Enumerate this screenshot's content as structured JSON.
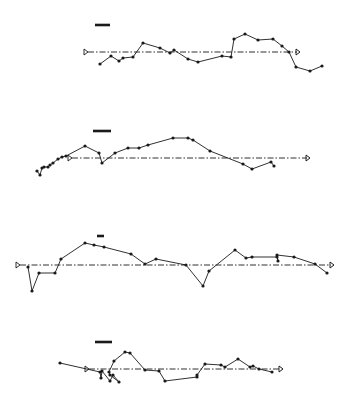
{
  "figure": {
    "width": 354,
    "height": 407,
    "background": "#ffffff",
    "ink": "#1a1a1a"
  },
  "chart_data": [
    {
      "type": "line",
      "title": "",
      "xlabel": "",
      "ylabel": "",
      "grid": false,
      "legend": null,
      "scale_bar": {
        "x1": 95,
        "x2": 110,
        "y": 25
      },
      "reference_arrow": {
        "x1": 84,
        "x2": 300,
        "y": 52,
        "style": "dash-dot",
        "start_marker": "triangle-open",
        "end_marker": "arrow-open"
      },
      "points": [
        [
          100,
          64
        ],
        [
          111,
          56
        ],
        [
          119,
          61
        ],
        [
          123,
          58
        ],
        [
          133,
          57
        ],
        [
          143,
          43
        ],
        [
          160,
          48
        ],
        [
          170,
          53
        ],
        [
          174,
          50
        ],
        [
          188,
          59
        ],
        [
          198,
          62
        ],
        [
          222,
          56
        ],
        [
          231,
          57
        ],
        [
          234,
          39
        ],
        [
          245,
          34
        ],
        [
          258,
          40
        ],
        [
          273,
          39
        ],
        [
          282,
          46
        ],
        [
          289,
          52
        ],
        [
          296,
          67
        ],
        [
          310,
          71
        ],
        [
          322,
          66
        ]
      ]
    },
    {
      "type": "line",
      "title": "",
      "xlabel": "",
      "ylabel": "",
      "grid": false,
      "legend": null,
      "scale_bar": {
        "x1": 93,
        "x2": 111,
        "y": 131
      },
      "reference_arrow": {
        "x1": 68,
        "x2": 310,
        "y": 158,
        "style": "dash-dot",
        "start_marker": "triangle-open",
        "end_marker": "arrow-open"
      },
      "points": [
        [
          37,
          171
        ],
        [
          40,
          175
        ],
        [
          42,
          168
        ],
        [
          44,
          167
        ],
        [
          48,
          167
        ],
        [
          50,
          165
        ],
        [
          53,
          163
        ],
        [
          58,
          159
        ],
        [
          62,
          157
        ],
        [
          66,
          156
        ],
        [
          85,
          146
        ],
        [
          99,
          153
        ],
        [
          102,
          163
        ],
        [
          115,
          153
        ],
        [
          128,
          148
        ],
        [
          139,
          148
        ],
        [
          148,
          145
        ],
        [
          173,
          138
        ],
        [
          188,
          138
        ],
        [
          193,
          140
        ],
        [
          210,
          151
        ],
        [
          243,
          164
        ],
        [
          252,
          169
        ],
        [
          271,
          162
        ],
        [
          274,
          166
        ]
      ]
    },
    {
      "type": "line",
      "title": "",
      "xlabel": "",
      "ylabel": "",
      "grid": false,
      "legend": null,
      "scale_bar": {
        "x1": 97,
        "x2": 104,
        "y": 236
      },
      "reference_arrow": {
        "x1": 16,
        "x2": 334,
        "y": 265,
        "style": "dash-dot",
        "start_marker": "triangle-open",
        "end_marker": "arrow-open"
      },
      "points": [
        [
          28,
          267
        ],
        [
          32,
          291
        ],
        [
          39,
          273
        ],
        [
          55,
          273
        ],
        [
          61,
          259
        ],
        [
          85,
          243
        ],
        [
          94,
          245
        ],
        [
          104,
          247
        ],
        [
          131,
          254
        ],
        [
          145,
          264
        ],
        [
          156,
          259
        ],
        [
          186,
          265
        ],
        [
          203,
          286
        ],
        [
          209,
          271
        ],
        [
          235,
          250
        ],
        [
          246,
          258
        ],
        [
          252,
          257
        ],
        [
          277,
          257
        ],
        [
          278,
          261
        ],
        [
          277,
          255
        ],
        [
          294,
          257
        ],
        [
          315,
          264
        ],
        [
          327,
          273
        ]
      ]
    },
    {
      "type": "line",
      "title": "",
      "xlabel": "",
      "ylabel": "",
      "grid": false,
      "legend": null,
      "scale_bar": {
        "x1": 95,
        "x2": 112,
        "y": 342
      },
      "reference_arrow": {
        "x1": 85,
        "x2": 283,
        "y": 369,
        "style": "dash-dot",
        "start_marker": "triangle-open",
        "end_marker": "arrow-open"
      },
      "points": [
        [
          60,
          363
        ],
        [
          100,
          372
        ],
        [
          101,
          378
        ],
        [
          102,
          371
        ],
        [
          110,
          381
        ],
        [
          113,
          375
        ],
        [
          119,
          382
        ],
        [
          110,
          375
        ],
        [
          109,
          372
        ],
        [
          114,
          361
        ],
        [
          125,
          352
        ],
        [
          130,
          353
        ],
        [
          145,
          370
        ],
        [
          159,
          371
        ],
        [
          165,
          381
        ],
        [
          197,
          377
        ],
        [
          197,
          375
        ],
        [
          205,
          364
        ],
        [
          221,
          365
        ],
        [
          225,
          367
        ],
        [
          238,
          359
        ],
        [
          250,
          367
        ],
        [
          253,
          366
        ],
        [
          259,
          369
        ],
        [
          272,
          372
        ]
      ]
    }
  ]
}
